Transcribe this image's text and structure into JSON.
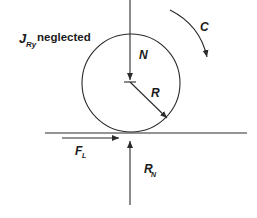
{
  "diagram": {
    "labels": {
      "inertia_symbol": "J",
      "inertia_subscript": "Ry",
      "inertia_note": "neglected",
      "normal_load": "N",
      "radius": "R",
      "couple": "C",
      "friction_symbol": "F",
      "friction_subscript": "L",
      "reaction_symbol": "R",
      "reaction_subscript": "N"
    },
    "colors": {
      "line": "#2a2a2a",
      "text": "#1a1a1a",
      "background": "#ffffff"
    }
  }
}
